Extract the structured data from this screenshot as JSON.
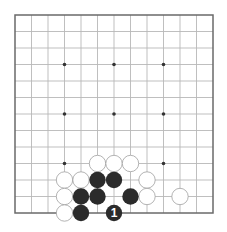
{
  "board": {
    "size": 13,
    "origin_x": 15,
    "origin_y": 15,
    "spacing": 16.5,
    "stone_radius": 8.2,
    "line_color": "#b8b8b8",
    "border_color": "#6a6a6a",
    "black_color": "#2b2b2b",
    "white_fill": "#ffffff",
    "white_stroke": "#a0a0a0",
    "hoshi_color": "#333333",
    "hoshi": [
      [
        3,
        3
      ],
      [
        6,
        3
      ],
      [
        9,
        3
      ],
      [
        3,
        6
      ],
      [
        6,
        6
      ],
      [
        9,
        6
      ],
      [
        3,
        9
      ],
      [
        9,
        9
      ]
    ]
  },
  "stones": {
    "white": [
      [
        5,
        9
      ],
      [
        6,
        9
      ],
      [
        7,
        9
      ],
      [
        3,
        10
      ],
      [
        4,
        10
      ],
      [
        8,
        10
      ],
      [
        3,
        11
      ],
      [
        8,
        11
      ],
      [
        10,
        11
      ],
      [
        3,
        12
      ]
    ],
    "black": [
      [
        5,
        10
      ],
      [
        6,
        10
      ],
      [
        4,
        11
      ],
      [
        5,
        11
      ],
      [
        7,
        11
      ],
      [
        4,
        12
      ]
    ],
    "numbered": [
      {
        "col": 6,
        "row": 12,
        "color": "black",
        "label": "1"
      }
    ]
  }
}
